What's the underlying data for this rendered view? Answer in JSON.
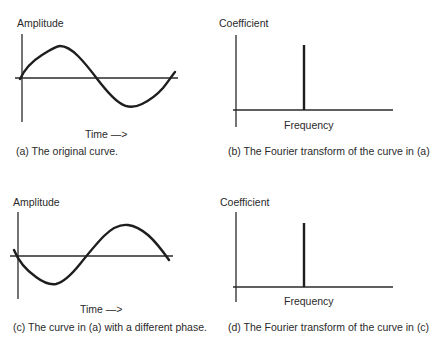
{
  "panels": [
    {
      "id": "a",
      "type": "time-domain",
      "y_label": "Amplitude",
      "x_label": "Time —>",
      "caption": "(a)  The original curve.",
      "curve": "sine wave starting at zero, rising to a peak, then falling through zero to a trough and rising again",
      "phase": "sine (starts rising)"
    },
    {
      "id": "b",
      "type": "frequency-domain",
      "y_label": "Coefficient",
      "x_label": "Frequency",
      "caption": "(b) The Fourier transform of the curve in (a)",
      "spike": "single vertical line at one frequency"
    },
    {
      "id": "c",
      "type": "time-domain",
      "y_label": "Amplitude",
      "x_label": "Time —>",
      "caption": "(c) The curve in (a) with a different phase.",
      "curve": "same sine wave shifted in phase: starts near zero, falls to a trough, then rises through zero to a peak",
      "phase": "inverted / shifted"
    },
    {
      "id": "d",
      "type": "frequency-domain",
      "y_label": "Coefficient",
      "x_label": "Frequency",
      "caption": "(d) The Fourier transform of the curve in (c)",
      "spike": "single vertical line at the same frequency and height as (b)"
    }
  ]
}
